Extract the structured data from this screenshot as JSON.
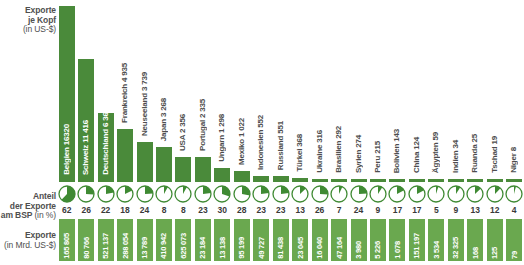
{
  "labels": {
    "per_capita_title": "Exporte",
    "per_capita_title2": "je Kopf",
    "per_capita_unit": "(in US-$)",
    "share_title": "Anteil",
    "share_title2": "der Exporte",
    "share_title3": "am BSP",
    "share_unit": "(in %)",
    "exports_title": "Exporte",
    "exports_unit": "(in Mrd. US-$)"
  },
  "colors": {
    "bar_green": "#4a8a3a",
    "box_green": "#6aa84f",
    "pie_green": "#3f8a33",
    "text_gray": "#4f4f4f"
  },
  "chart_data": {
    "type": "bar",
    "title": "Exporte je Kopf (in US-$)",
    "xlabel": "",
    "ylabel": "Exporte je Kopf (in US-$)",
    "ylim": [
      0,
      16320
    ],
    "grid": false,
    "legend": "none",
    "categories": [
      "Belgien",
      "Schweiz",
      "Deutschland",
      "Frankreich",
      "Neuseeland",
      "Japan",
      "USA",
      "Portugal",
      "Ungarn",
      "Mexiko",
      "Indonesien",
      "Russland",
      "Türkei",
      "Ukraine",
      "Brasilien",
      "Syrien",
      "Peru",
      "Bolivien",
      "China",
      "Ägypten",
      "Indien",
      "Ruanda",
      "Tschad",
      "Niger"
    ],
    "series": [
      {
        "name": "Exporte je Kopf (in US-$)",
        "values": [
          16320,
          11416,
          6362,
          4935,
          3739,
          3268,
          2356,
          2335,
          1298,
          1022,
          552,
          551,
          368,
          316,
          292,
          274,
          215,
          143,
          124,
          59,
          34,
          25,
          19,
          8
        ]
      },
      {
        "name": "Anteil der Exporte am BSP (in %)",
        "values": [
          62,
          26,
          22,
          18,
          24,
          8,
          8,
          23,
          30,
          28,
          23,
          23,
          13,
          26,
          7,
          24,
          9,
          17,
          17,
          5,
          9,
          13,
          12,
          4
        ]
      },
      {
        "name": "Exporte (in Mrd. US-$)",
        "values": [
          165805,
          80766,
          521137,
          288054,
          13789,
          410942,
          625073,
          23184,
          13138,
          95199,
          49727,
          81438,
          23045,
          16040,
          47164,
          3980,
          5226,
          1078,
          151197,
          3534,
          32325,
          168,
          125,
          79
        ]
      }
    ],
    "per_capita_display": [
      "16320",
      "11 416",
      "6 362",
      "4 935",
      "3 739",
      "3 268",
      "2 356",
      "2 335",
      "1 298",
      "1 022",
      "552",
      "551",
      "368",
      "316",
      "292",
      "274",
      "215",
      "143",
      "124",
      "59",
      "34",
      "25",
      "19",
      "8"
    ],
    "exports_display": [
      "165 805",
      "80 766",
      "521 137",
      "288 054",
      "13 789",
      "410 942",
      "625 073",
      "23 184",
      "13 138",
      "95 199",
      "49 727",
      "81 438",
      "23 045",
      "16 040",
      "47 164",
      "3 980",
      "5 226",
      "1 078",
      "151 197",
      "3 534",
      "32 325",
      "168",
      "125",
      "79"
    ],
    "label_inside_bar": [
      true,
      true,
      true,
      false,
      false,
      false,
      false,
      false,
      false,
      false,
      false,
      false,
      false,
      false,
      false,
      false,
      false,
      false,
      false,
      false,
      false,
      false,
      false,
      false
    ]
  }
}
